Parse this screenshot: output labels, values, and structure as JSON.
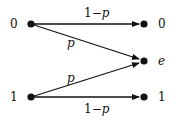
{
  "diagram": {
    "title": "",
    "type": "binary-erasure-channel",
    "inputs": [
      {
        "id": "in0",
        "label": "0"
      },
      {
        "id": "in1",
        "label": "1"
      }
    ],
    "outputs": [
      {
        "id": "out0",
        "label": "0"
      },
      {
        "id": "oute",
        "label": "e"
      },
      {
        "id": "out1",
        "label": "1"
      }
    ],
    "edges": [
      {
        "from": "in0",
        "to": "out0",
        "label": "1−p",
        "label_plain": "1−",
        "label_var": "p"
      },
      {
        "from": "in0",
        "to": "oute",
        "label": "p"
      },
      {
        "from": "in1",
        "to": "oute",
        "label": "p"
      },
      {
        "from": "in1",
        "to": "out1",
        "label": "1−p",
        "label_plain": "1−",
        "label_var": "p"
      }
    ],
    "colors": {
      "stroke": "#111111",
      "node": "#111111",
      "background": "#ffffff"
    }
  }
}
